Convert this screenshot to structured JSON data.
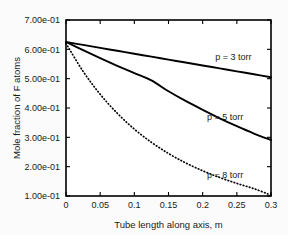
{
  "chart_data": {
    "type": "line",
    "title": "",
    "xlabel": "Tube length along axis, m",
    "ylabel": "Mole fraction of F atoms",
    "xlim": [
      0,
      0.3
    ],
    "ylim": [
      0.1,
      0.7
    ],
    "grid": false,
    "legend_position": "inline-annotations",
    "xticks": [
      0,
      0.05,
      0.1,
      0.15,
      0.2,
      0.25,
      0.3
    ],
    "xticklabels": [
      "0",
      "0.05",
      "0.1",
      "0.15",
      "0.2",
      "0.25",
      "0.3"
    ],
    "yticks": [
      0.1,
      0.2,
      0.3,
      0.4,
      0.5,
      0.6,
      0.7
    ],
    "yticklabels": [
      "1.00e-01",
      "2.00e-01",
      "3.00e-01",
      "4.00e-01",
      "5.00e-01",
      "6.00e-01",
      "7.00e-01"
    ],
    "x": [
      0,
      0.025,
      0.05,
      0.075,
      0.1,
      0.125,
      0.15,
      0.175,
      0.2,
      0.225,
      0.25,
      0.275,
      0.3
    ],
    "series": [
      {
        "name": "p = 3 torr",
        "style": "solid",
        "color": "#000000",
        "label": "p = 3 torr",
        "values": [
          0.625,
          0.615,
          0.605,
          0.595,
          0.585,
          0.575,
          0.565,
          0.555,
          0.545,
          0.535,
          0.525,
          0.515,
          0.505
        ]
      },
      {
        "name": "p = 5 torr",
        "style": "solid",
        "color": "#000000",
        "label": "p = 5 torr",
        "values": [
          0.625,
          0.597,
          0.57,
          0.544,
          0.519,
          0.494,
          0.457,
          0.424,
          0.394,
          0.365,
          0.338,
          0.313,
          0.291
        ]
      },
      {
        "name": "p = 8 torr",
        "style": "dotted",
        "color": "#000000",
        "label": "p = 8 torr",
        "values": [
          0.62,
          0.525,
          0.447,
          0.382,
          0.328,
          0.283,
          0.245,
          0.213,
          0.186,
          0.163,
          0.143,
          0.125,
          0.103
        ]
      }
    ],
    "annotations": [
      {
        "text": "p = 3 torr",
        "x": 0.245,
        "y": 0.565
      },
      {
        "text": "p = 5 torr",
        "x": 0.233,
        "y": 0.358
      },
      {
        "text": "p = 8 torr",
        "x": 0.233,
        "y": 0.163
      }
    ]
  }
}
